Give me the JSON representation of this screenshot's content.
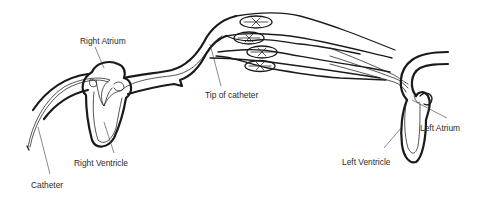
{
  "diagram": {
    "labels": {
      "right_atrium": "Right Atrium",
      "right_ventricle": "Right Ventricle",
      "catheter": "Catheter",
      "tip_of_catheter": "Tip of catheter",
      "left_ventricle": "Left Ventricle",
      "left_atrium": "Left Atrium"
    },
    "colors": {
      "line": "#1a1a1a",
      "text": "#2a2a2a",
      "background": "#ffffff"
    }
  }
}
